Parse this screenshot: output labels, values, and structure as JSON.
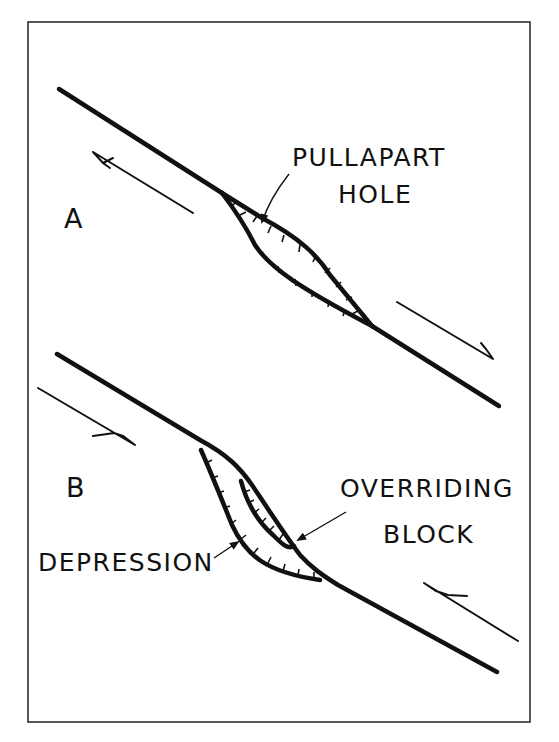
{
  "figure": {
    "panels": [
      {
        "id": "A",
        "label": "A",
        "feature_label_line1": "PULLAPART",
        "feature_label_line2": "HOLE",
        "sense_of_motion": "left-lateral (arrows: upper-left block moves NW, lower-right block moves SE)"
      },
      {
        "id": "B",
        "label": "B",
        "feature_label_line1": "OVERRIDING",
        "feature_label_line2": "BLOCK",
        "secondary_label": "DEPRESSION",
        "sense_of_motion": "right-lateral (arrows: upper-left block moves SE, lower-right block moves NW)"
      }
    ],
    "colors": {
      "ink": "#111111",
      "background": "#ffffff"
    }
  }
}
